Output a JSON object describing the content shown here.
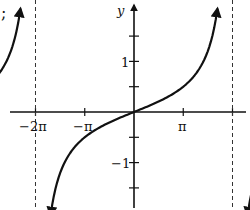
{
  "leading_mark": ";",
  "chart_data": {
    "type": "line",
    "title": "",
    "function": "y = tan(x/2)",
    "xlabel": "",
    "ylabel": "y",
    "xlim": [
      -7.33,
      7.33
    ],
    "ylim": [
      -4.3,
      4.3
    ],
    "grid": false,
    "x_tick_labels": [
      {
        "label": "−2π",
        "value": -6.283
      },
      {
        "label": "−π",
        "value": -3.142
      },
      {
        "label": "π",
        "value": 3.142
      }
    ],
    "x_ticks_count_per_pi": 2,
    "y_tick_labels": [
      {
        "label": "1",
        "value": 1
      },
      {
        "label": "−1",
        "value": -1
      }
    ],
    "y_ticks": [
      -3,
      -2,
      -1,
      1,
      2,
      3
    ],
    "asymptotes": [
      {
        "x_label": "−π",
        "x": -3.142,
        "style": "dashed"
      },
      {
        "x_label": "π",
        "x": 3.142,
        "style": "dashed"
      }
    ],
    "endpoints": [
      {
        "label": "(−2π, 0)",
        "x": -6.283,
        "y": 0,
        "filled": true
      },
      {
        "label": "(2π, 0)",
        "x": 6.283,
        "y": 0,
        "filled": true
      }
    ],
    "series": [
      {
        "name": "branch-left",
        "domain": [
          "−2π",
          "−π"
        ],
        "values": [
          [
            -6.283,
            0
          ],
          [
            -5.5,
            0.41
          ],
          [
            -4.712,
            1
          ],
          [
            -4.0,
            2.0
          ],
          [
            -3.6,
            4.3
          ]
        ],
        "arrow": "up"
      },
      {
        "name": "branch-center",
        "domain": [
          "−π",
          "π"
        ],
        "values": [
          [
            -2.7,
            -4.3
          ],
          [
            -2.0,
            -1.56
          ],
          [
            -1.571,
            -1
          ],
          [
            0,
            0
          ],
          [
            1.571,
            1
          ],
          [
            2.0,
            1.56
          ],
          [
            2.7,
            4.3
          ]
        ],
        "arrow": "both"
      },
      {
        "name": "branch-right",
        "domain": [
          "π",
          "2π"
        ],
        "values": [
          [
            3.6,
            -4.3
          ],
          [
            4.0,
            -2.0
          ],
          [
            4.712,
            -1
          ],
          [
            5.5,
            -0.41
          ],
          [
            6.283,
            0
          ]
        ],
        "arrow": "down"
      }
    ]
  }
}
